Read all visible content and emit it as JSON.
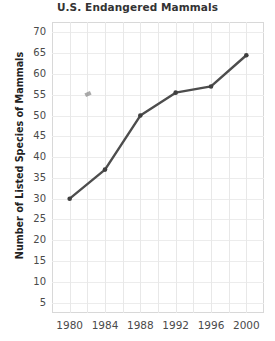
{
  "chart_data": {
    "type": "line",
    "title": "U.S. Endangered Mammals",
    "xlabel": "",
    "ylabel": "Number of Listed Species of Mammals",
    "x": [
      1980,
      1984,
      1988,
      1992,
      1996,
      2000
    ],
    "x_tick_labels": [
      "1980",
      "1984",
      "1988",
      "1992",
      "1996",
      "2000"
    ],
    "values": [
      30,
      37,
      50,
      55.5,
      57,
      64.5
    ],
    "series": [
      {
        "name": "Listed Species of Mammals",
        "values": [
          30,
          37,
          50,
          55.5,
          57,
          64.5
        ]
      }
    ],
    "y_tick_labels": [
      "70",
      "65",
      "60",
      "55",
      "50",
      "45",
      "40",
      "35",
      "30",
      "25",
      "20",
      "15",
      "10",
      "5"
    ],
    "y_ticks": [
      70,
      65,
      60,
      55,
      50,
      45,
      40,
      35,
      30,
      25,
      20,
      15,
      10,
      5
    ],
    "ylim": [
      2.5,
      72.5
    ],
    "xlim": [
      1978,
      2002
    ],
    "grid": true,
    "legend": "none",
    "line_color": "#4d4d4d",
    "marker_color": "#3f3f3f",
    "grid_color": "#e8e8e8",
    "frame_color": "#d8d8d8"
  }
}
